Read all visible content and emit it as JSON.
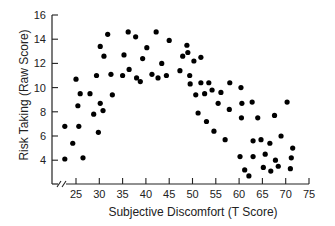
{
  "chart_data": {
    "type": "scatter",
    "title": "",
    "xlabel": "Subjective Discomfort (T Score)",
    "ylabel": "Risk Taking (Raw Score)",
    "xlim": [
      22,
      75
    ],
    "ylim": [
      2.5,
      16
    ],
    "xticks": [
      25,
      30,
      35,
      40,
      45,
      50,
      55,
      60,
      65,
      70,
      75
    ],
    "yticks": [
      4,
      6,
      8,
      10,
      12,
      14,
      16
    ],
    "axis_break": "x",
    "grid": false,
    "legend": null,
    "marker_color": "#000000",
    "points": [
      [
        22.6,
        4.1
      ],
      [
        22.6,
        6.8
      ],
      [
        24.3,
        5.4
      ],
      [
        25.0,
        10.7
      ],
      [
        25.4,
        8.5
      ],
      [
        25.6,
        6.8
      ],
      [
        26.5,
        4.2
      ],
      [
        25.9,
        9.5
      ],
      [
        28.0,
        9.5
      ],
      [
        28.8,
        7.8
      ],
      [
        29.4,
        11.0
      ],
      [
        29.8,
        6.3
      ],
      [
        30.2,
        8.7
      ],
      [
        30.2,
        13.4
      ],
      [
        30.8,
        8.1
      ],
      [
        31.0,
        12.6
      ],
      [
        31.8,
        14.4
      ],
      [
        32.5,
        11.1
      ],
      [
        32.8,
        9.4
      ],
      [
        35.0,
        11.0
      ],
      [
        35.3,
        12.7
      ],
      [
        36.2,
        14.6
      ],
      [
        36.4,
        11.5
      ],
      [
        37.8,
        14.2
      ],
      [
        38.0,
        10.8
      ],
      [
        38.8,
        10.5
      ],
      [
        39.3,
        12.4
      ],
      [
        40.2,
        13.3
      ],
      [
        41.3,
        11.1
      ],
      [
        42.2,
        14.6
      ],
      [
        42.6,
        10.8
      ],
      [
        43.4,
        12.0
      ],
      [
        44.4,
        11.0
      ],
      [
        45.0,
        13.9
      ],
      [
        47.3,
        11.4
      ],
      [
        47.9,
        12.6
      ],
      [
        48.8,
        13.5
      ],
      [
        49.0,
        12.9
      ],
      [
        49.4,
        11.0
      ],
      [
        49.5,
        10.3
      ],
      [
        50.3,
        12.2
      ],
      [
        50.7,
        9.4
      ],
      [
        51.2,
        7.9
      ],
      [
        51.8,
        12.5
      ],
      [
        51.8,
        10.4
      ],
      [
        52.6,
        9.5
      ],
      [
        53.0,
        7.2
      ],
      [
        53.5,
        10.4
      ],
      [
        54.2,
        9.8
      ],
      [
        54.6,
        6.4
      ],
      [
        55.5,
        8.7
      ],
      [
        56.1,
        9.6
      ],
      [
        57.0,
        5.7
      ],
      [
        57.9,
        8.2
      ],
      [
        58.0,
        10.4
      ],
      [
        60.4,
        10.0
      ],
      [
        60.2,
        4.3
      ],
      [
        60.5,
        7.5
      ],
      [
        60.6,
        8.7
      ],
      [
        61.2,
        3.2
      ],
      [
        62.1,
        2.7
      ],
      [
        62.8,
        8.8
      ],
      [
        63.0,
        5.6
      ],
      [
        63.0,
        4.3
      ],
      [
        64.0,
        7.5
      ],
      [
        64.7,
        5.7
      ],
      [
        65.2,
        3.4
      ],
      [
        65.6,
        4.5
      ],
      [
        66.6,
        5.4
      ],
      [
        66.8,
        3.1
      ],
      [
        67.6,
        7.7
      ],
      [
        67.8,
        4.0
      ],
      [
        68.4,
        3.5
      ],
      [
        69.0,
        6.0
      ],
      [
        70.3,
        8.8
      ],
      [
        71.2,
        4.2
      ],
      [
        71.0,
        3.3
      ],
      [
        71.5,
        5.0
      ]
    ]
  }
}
